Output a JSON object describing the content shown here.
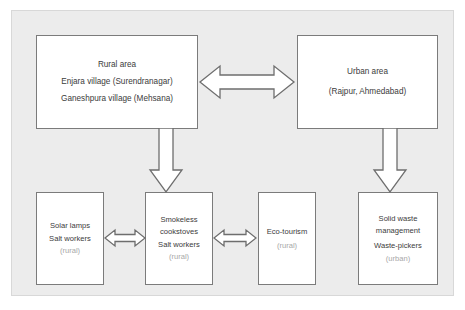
{
  "diagram": {
    "background_color": "#ececec",
    "page_color": "#ffffff",
    "node_border_color": "#7b7b7b",
    "text_color": "#3b3b3b",
    "muted_text_color": "#a8a8a8",
    "arrow_fill": "#ffffff",
    "arrow_stroke": "#6e6e6e",
    "nodes": {
      "rural_area": {
        "title": "Rural area",
        "line2": "Enjara village (Surendranagar)",
        "line3": "Ganeshpura village (Mehsana)"
      },
      "urban_area": {
        "title": "Urban area",
        "line2": "(Rajpur, Ahmedabad)"
      },
      "solar_lamps": {
        "line1": "Solar lamps",
        "line2": "Salt workers",
        "line3": "(rural)"
      },
      "smokeless_cookstoves": {
        "line1": "Smokeless",
        "line2": "cookstoves",
        "line3": "Salt workers",
        "line4": "(rural)"
      },
      "eco_tourism": {
        "line1": "Eco-tourism",
        "line2": "(rural)"
      },
      "solid_waste_management": {
        "line1": "Solid waste",
        "line2": "management",
        "line3": "Waste-pickers",
        "line4": "(urban)"
      }
    },
    "connectors": [
      {
        "name": "rural-urban-link",
        "from": "rural_area",
        "to": "urban_area",
        "direction": "bidirectional",
        "orientation": "horizontal"
      },
      {
        "name": "rural-cookstoves-link",
        "from": "rural_area",
        "to": "smokeless_cookstoves",
        "direction": "down",
        "orientation": "vertical"
      },
      {
        "name": "urban-waste-link",
        "from": "urban_area",
        "to": "solid_waste_management",
        "direction": "down",
        "orientation": "vertical"
      },
      {
        "name": "solar-cookstoves-link",
        "from": "solar_lamps",
        "to": "smokeless_cookstoves",
        "direction": "bidirectional",
        "orientation": "horizontal"
      },
      {
        "name": "cookstoves-ecotourism-link",
        "from": "smokeless_cookstoves",
        "to": "eco_tourism",
        "direction": "bidirectional",
        "orientation": "horizontal"
      }
    ]
  }
}
